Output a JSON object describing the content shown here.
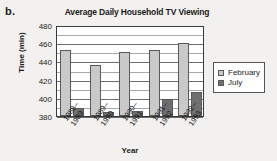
{
  "figure": {
    "label": "b.",
    "x_axis_title": "Year",
    "y_axis_title": "Time (min)"
  },
  "legend": {
    "position": "right",
    "entries": [
      {
        "label": "February",
        "color": "#c9c9c9"
      },
      {
        "label": "July",
        "color": "#6f6f6f"
      }
    ]
  },
  "chart_data": {
    "type": "bar",
    "title": "Average Daily Household TV Viewing",
    "xlabel": "Year",
    "ylabel": "Time (min)",
    "ylim": [
      380,
      480
    ],
    "ytick_labels": [
      "380",
      "400",
      "420",
      "440",
      "460",
      "480"
    ],
    "ytick_values": [
      380,
      400,
      420,
      440,
      460,
      480
    ],
    "gridline_interval": 10,
    "grid": true,
    "categories": [
      "1988–\n1989",
      "1989–\n1990",
      "1990–\n1991",
      "1991–\n1992",
      "1992–\n1993"
    ],
    "category_labels_line1": [
      "1988–",
      "1989–",
      "1990–",
      "1991–",
      "1992–"
    ],
    "category_labels_line2": [
      "1989",
      "1990",
      "1991",
      "1992",
      "1993"
    ],
    "series": [
      {
        "name": "February",
        "color": "#c9c9c9",
        "values": [
          453,
          436,
          450,
          453,
          460
        ]
      },
      {
        "name": "July",
        "color": "#6f6f6f",
        "values": [
          389,
          384,
          385,
          399,
          406
        ]
      }
    ]
  }
}
